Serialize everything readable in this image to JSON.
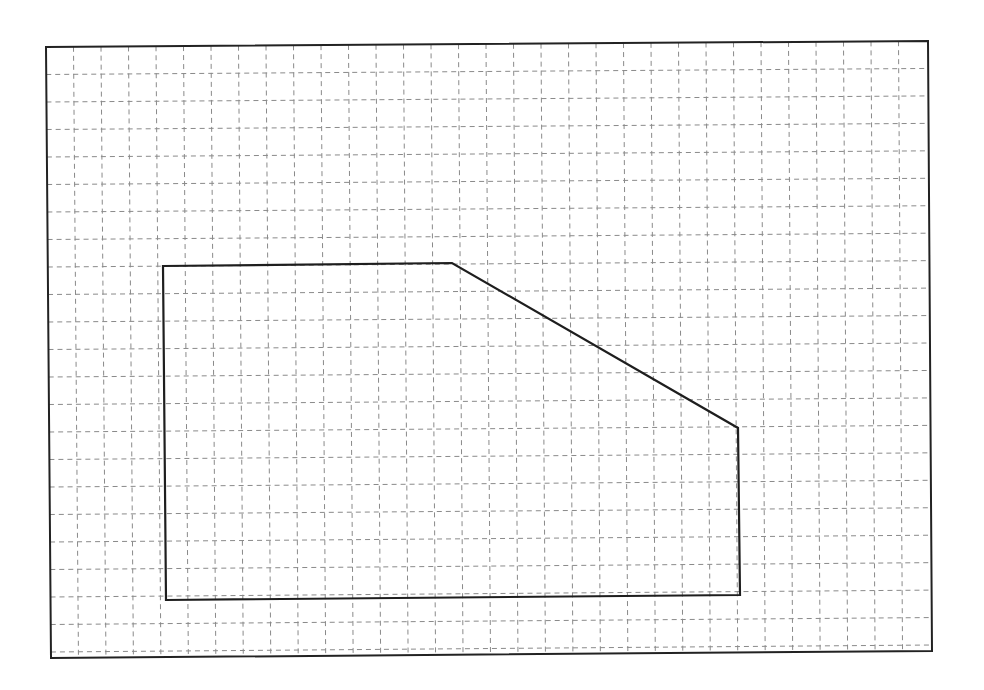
{
  "diagram": {
    "type": "grid-polygon",
    "frame": {
      "corners": [
        [
          46,
          47
        ],
        [
          928,
          41
        ],
        [
          932,
          651
        ],
        [
          51,
          658
        ]
      ],
      "color": "#222222"
    },
    "grid": {
      "origin": [
        46,
        47
      ],
      "cell_size": 27.5,
      "columns": 32,
      "rows": 22,
      "line_color": "#8a8a8a",
      "line_style": "dashed"
    },
    "polygon": {
      "vertices": [
        [
          163,
          266
        ],
        [
          452,
          263
        ],
        [
          738,
          428
        ],
        [
          740,
          595
        ],
        [
          166,
          600
        ]
      ],
      "vertex_grid_coords": [
        [
          4,
          8
        ],
        [
          14.5,
          8
        ],
        [
          25,
          14
        ],
        [
          25,
          20
        ],
        [
          4,
          20
        ]
      ],
      "stroke_color": "#1e1e1e"
    }
  }
}
